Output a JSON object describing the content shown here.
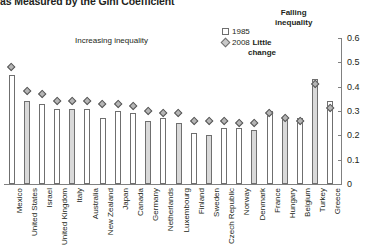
{
  "chart_title": "as Measured by the Gini Coefficient",
  "legend": [
    {
      "name": "series-1985",
      "label": "1985",
      "marker": "open-square-icon"
    },
    {
      "name": "series-2008",
      "label": "2008",
      "marker": "grey-diamond-icon"
    }
  ],
  "annotations": [
    {
      "name": "annotation-increasing-inequality",
      "text": "Increasing inequality"
    },
    {
      "name": "annotation-little-change",
      "line1": "Little",
      "line2": "change"
    },
    {
      "name": "annotation-falling-inequality",
      "line1": "Falling",
      "line2": "inequality"
    }
  ],
  "axis": {
    "y_ticks": [
      "0.6",
      "0.5",
      "0.4",
      "0.3",
      "0.2",
      "0.1",
      "0"
    ]
  },
  "chart_data": {
    "type": "bar",
    "title": "as Measured by the Gini Coefficient",
    "xlabel": "",
    "ylabel": "",
    "ylim": [
      0,
      0.6
    ],
    "yticks": [
      0,
      0.1,
      0.2,
      0.3,
      0.4,
      0.5,
      0.6
    ],
    "grid": false,
    "legend_position": "top-right",
    "categories": [
      "Mexico",
      "United States",
      "Israel",
      "United Kingdom",
      "Italy",
      "Australia",
      "New Zealand",
      "Japan",
      "Canada",
      "Germany",
      "Netherlands",
      "Luxembourg",
      "Finland",
      "Sweden",
      "Czech Republic",
      "Norway",
      "Denmark",
      "France",
      "Hungary",
      "Belgium",
      "Turkey",
      "Greece"
    ],
    "series": [
      {
        "name": "1985",
        "marker": "bar",
        "values": [
          0.45,
          0.34,
          0.33,
          0.31,
          0.31,
          0.31,
          0.27,
          0.3,
          0.29,
          0.26,
          0.27,
          0.25,
          0.21,
          0.2,
          0.23,
          0.23,
          0.22,
          0.3,
          0.27,
          0.27,
          0.43,
          0.34
        ]
      },
      {
        "name": "2008",
        "marker": "diamond",
        "values": [
          0.48,
          0.38,
          0.37,
          0.34,
          0.34,
          0.34,
          0.33,
          0.33,
          0.32,
          0.3,
          0.29,
          0.29,
          0.26,
          0.26,
          0.26,
          0.25,
          0.25,
          0.29,
          0.27,
          0.26,
          0.41,
          0.31
        ]
      }
    ]
  }
}
